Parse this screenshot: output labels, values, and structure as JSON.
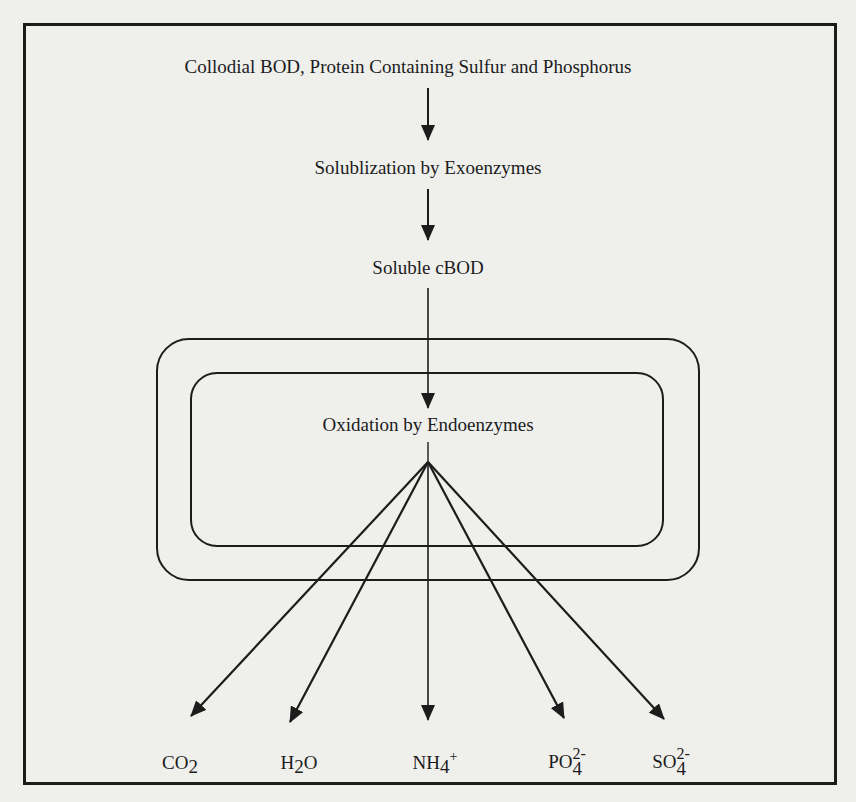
{
  "diagram": {
    "title": "Collodial BOD, Protein Containing Sulfur and Phosphorus",
    "step_solubilization": "Solublization by Exoenzymes",
    "step_soluble": "Soluble cBOD",
    "step_oxidation": "Oxidation by Endoenzymes",
    "products": [
      {
        "base": "CO",
        "sub": "2",
        "sup": ""
      },
      {
        "base": "H",
        "sub": "2",
        "tail": "O"
      },
      {
        "base": "NH",
        "sub": "4",
        "sup": "+"
      },
      {
        "base": "PO",
        "sub": "4",
        "sup": "2-"
      },
      {
        "base": "SO",
        "sub": "4",
        "sup": "2-"
      }
    ],
    "colors": {
      "ink": "#1c1c1c",
      "paper": "#efefec"
    }
  }
}
